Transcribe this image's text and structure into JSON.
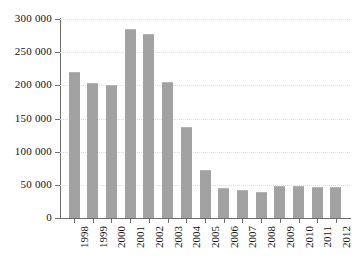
{
  "chart_data": {
    "type": "bar",
    "title": "",
    "subtitle": "",
    "xlabel": "",
    "ylabel": "",
    "categories": [
      "1998",
      "1999",
      "2000",
      "2001",
      "2002",
      "2003",
      "2004",
      "2005",
      "2006",
      "2007",
      "2008",
      "2009",
      "2010",
      "2011",
      "2012"
    ],
    "values": [
      220000,
      204000,
      201000,
      285000,
      277000,
      205000,
      137000,
      73000,
      46000,
      42000,
      39000,
      48000,
      49000,
      47000,
      47000
    ],
    "series": [
      {
        "name": "",
        "values": [
          220000,
          204000,
          201000,
          285000,
          277000,
          205000,
          137000,
          73000,
          46000,
          42000,
          39000,
          48000,
          49000,
          47000,
          47000
        ]
      }
    ],
    "ylim": [
      0,
      300000
    ],
    "ytick_values": [
      0,
      50000,
      100000,
      150000,
      200000,
      250000,
      300000
    ],
    "ytick_labels": [
      "0",
      "50 000",
      "100 000",
      "150 000",
      "200 000",
      "250 000",
      "300 000"
    ],
    "grid": true,
    "grid_axis": "y",
    "legend": false,
    "legend_position": "none",
    "annotations": [],
    "bar_color": "#a2a2a2",
    "grid_color": "#dcdce4",
    "axis_color": "#6d6d6d",
    "background_color": "#ffffff",
    "x_label_rotation": 90
  }
}
